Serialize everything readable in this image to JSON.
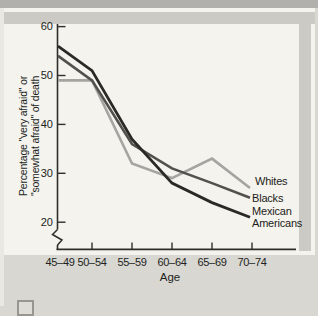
{
  "figure": {
    "ylabel_line1": "Percentage \"very afraid\" or",
    "ylabel_line2": "\"somewhat afraid\" of death"
  },
  "chart_data": {
    "type": "line",
    "title": "",
    "xlabel": "Age",
    "ylabel": "Percentage \"very afraid\" or \"somewhat afraid\" of death",
    "categories": [
      "45–49",
      "50–54",
      "55–59",
      "60–64",
      "65–69",
      "70–74"
    ],
    "series": [
      {
        "name": "Whites",
        "label_lines": [
          "Whites"
        ],
        "color": "#a5a4a1",
        "values": [
          49,
          49,
          32,
          29,
          33,
          27
        ]
      },
      {
        "name": "Blacks",
        "label_lines": [
          "Blacks"
        ],
        "color": "#53514d",
        "values": [
          54,
          49,
          36,
          31,
          28,
          25
        ]
      },
      {
        "name": "Mexican Americans",
        "label_lines": [
          "Mexican",
          "Americans"
        ],
        "color": "#2a2926",
        "values": [
          56,
          51,
          37,
          28,
          24,
          21
        ]
      }
    ],
    "y_ticks": [
      60,
      50,
      40,
      30,
      20
    ],
    "ylim": [
      20,
      60
    ],
    "axis_break": true,
    "grid": false,
    "legend_position": "labels-at-line-ends"
  }
}
